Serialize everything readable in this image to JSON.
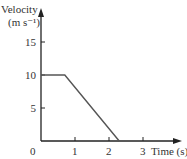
{
  "chart_data": {
    "type": "line",
    "title": "",
    "ylabel": "Velocity",
    "yunit": "(m s⁻¹)",
    "xlabel": "Time (s)",
    "x": [
      0,
      0.7,
      2.3
    ],
    "series": [
      {
        "name": "velocity",
        "values": [
          10,
          10,
          0
        ]
      }
    ],
    "xticks": [
      "0",
      "1",
      "2",
      "3"
    ],
    "yticks": [
      "5",
      "10",
      "15"
    ],
    "xlim": [
      0,
      3.6
    ],
    "ylim": [
      0,
      18
    ],
    "grid": false,
    "legend": "none"
  },
  "colors": {
    "axis": "#222222",
    "line": "#555555"
  }
}
